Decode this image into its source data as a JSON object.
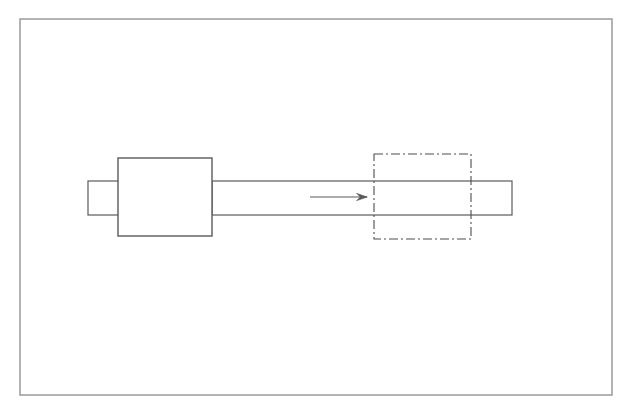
{
  "figure": {
    "description": "Engineering-style 2D line drawing: a stepped shaft with a left end stub, a rectangular block body, a long cylindrical shaft, a horizontal right-pointing arrow, and a dash-dot (chain line) rectangle outlining a region on the shaft.",
    "canvas": {
      "width": 631,
      "height": 412
    },
    "background_color": "#ffffff",
    "line_color": "#5a5a5a",
    "frame_color": "#9a9a9a",
    "has_text_labels": false,
    "text_labels": []
  },
  "chart_data": {
    "type": "diagram",
    "xlabel": "",
    "ylabel": "",
    "grid": false,
    "legend": "none",
    "xlim": [
      0,
      631
    ],
    "ylim": [
      0,
      412
    ],
    "annotations": [],
    "shapes": [
      {
        "id": "outer-frame",
        "name": "outer-frame",
        "kind": "rectangle",
        "x": 20,
        "y": 19,
        "width": 592,
        "height": 376,
        "stroke": "#9a9a9a",
        "stroke_width": 1.5,
        "line_style": "solid",
        "fill": "none"
      },
      {
        "id": "left-end-stub",
        "name": "left-end-stub",
        "kind": "rectangle",
        "x": 88,
        "y": 181,
        "width": 32,
        "height": 34,
        "stroke": "#5a5a5a",
        "stroke_width": 1.2,
        "line_style": "solid",
        "fill": "none"
      },
      {
        "id": "main-block-body",
        "name": "main-block-body",
        "kind": "rectangle",
        "x": 118,
        "y": 158,
        "width": 94,
        "height": 78,
        "stroke": "#5a5a5a",
        "stroke_width": 1.4,
        "line_style": "solid",
        "fill": "none"
      },
      {
        "id": "shaft",
        "name": "shaft",
        "kind": "rectangle",
        "x": 212,
        "y": 181,
        "width": 300,
        "height": 34,
        "stroke": "#5a5a5a",
        "stroke_width": 1.2,
        "line_style": "solid",
        "fill": "none"
      },
      {
        "id": "chain-line-region-box",
        "name": "chain-line-region-box",
        "kind": "rectangle",
        "x": 374,
        "y": 154,
        "width": 97,
        "height": 85,
        "stroke": "#4d4d4d",
        "stroke_width": 1.1,
        "line_style": "dash-dot",
        "dash_array": "9,3,2,3",
        "fill": "none"
      },
      {
        "id": "direction-arrow",
        "name": "direction-arrow",
        "kind": "arrow",
        "x1": 310,
        "y1": 197,
        "x2": 367,
        "y2": 197,
        "direction": "right",
        "stroke": "#5a5a5a",
        "stroke_width": 1.1,
        "line_style": "solid",
        "arrowhead": "open-barbed"
      }
    ]
  }
}
